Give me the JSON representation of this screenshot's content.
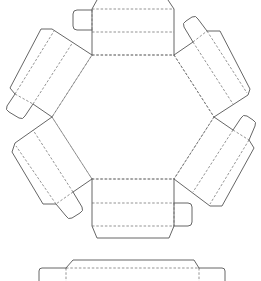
{
  "diagram": {
    "type": "die-cut template",
    "title": "",
    "colors": {
      "cut_line": "#555555",
      "fold_line": "#666666",
      "background": "#ffffff"
    },
    "line_legend": [
      {
        "style": "solid",
        "meaning": "cut line"
      },
      {
        "style": "dashed",
        "meaning": "fold line"
      }
    ],
    "hexagon_base": {
      "vertices": [
        [
          92,
          55
        ],
        [
          174,
          55
        ],
        [
          214,
          117
        ],
        [
          174,
          179
        ],
        [
          92,
          179
        ],
        [
          52,
          117
        ]
      ]
    },
    "panels": [
      {
        "id": "top",
        "position": "top",
        "has_glue_tab": true,
        "tab_side": "left"
      },
      {
        "id": "upper-right",
        "position": "upper-right",
        "has_glue_tab": true,
        "tab_side": "outer-top"
      },
      {
        "id": "lower-right",
        "position": "lower-right",
        "has_glue_tab": true,
        "tab_side": "outer-top"
      },
      {
        "id": "bottom",
        "position": "bottom",
        "has_glue_tab": true,
        "tab_side": "right"
      },
      {
        "id": "lower-left",
        "position": "lower-left",
        "has_glue_tab": true,
        "tab_side": "outer-bottom"
      },
      {
        "id": "upper-left",
        "position": "upper-left",
        "has_glue_tab": true,
        "tab_side": "outer-bottom"
      }
    ],
    "lid_strip": {
      "position": "bottom",
      "partial": true
    }
  }
}
